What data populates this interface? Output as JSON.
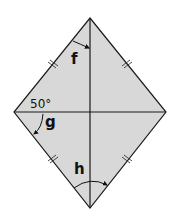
{
  "diagram": {
    "shape": "rhombus",
    "fill_color": "#d8d8d8",
    "stroke_color": "#1a1a1a",
    "vertices": {
      "top": [
        90,
        18
      ],
      "right": [
        166,
        112
      ],
      "bottom": [
        90,
        208
      ],
      "left": [
        14,
        112
      ]
    },
    "diagonals": [
      "vertical",
      "horizontal"
    ],
    "equal_side_marks": "double tick on each of the four sides",
    "angle_labels": {
      "given": "50°",
      "f": "f",
      "g": "g",
      "h": "h"
    }
  }
}
